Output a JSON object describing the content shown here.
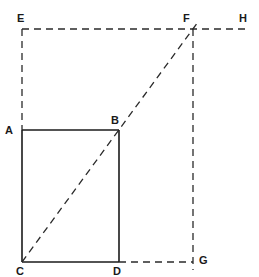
{
  "diagram": {
    "points": {
      "E": "E",
      "F": "F",
      "H": "H",
      "A": "A",
      "B": "B",
      "C": "C",
      "D": "D",
      "G": "G"
    },
    "segments": [
      {
        "from": "A",
        "to": "B",
        "style": "solid"
      },
      {
        "from": "A",
        "to": "C",
        "style": "solid"
      },
      {
        "from": "C",
        "to": "D",
        "style": "solid"
      },
      {
        "from": "B",
        "to": "D",
        "style": "solid"
      },
      {
        "from": "E",
        "to": "A",
        "style": "dashed"
      },
      {
        "from": "E",
        "to": "H",
        "style": "dashed"
      },
      {
        "from": "C",
        "to": "F",
        "style": "dashed"
      },
      {
        "from": "F",
        "to": "G",
        "style": "dashed"
      },
      {
        "from": "D",
        "to": "G",
        "style": "dashed"
      }
    ],
    "colors": {
      "ink": "#1a1a1a",
      "background": "#ffffff"
    }
  }
}
